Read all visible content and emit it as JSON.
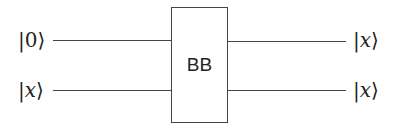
{
  "diagram": {
    "type": "quantum-circuit",
    "gate": {
      "label": "BB"
    },
    "inputs": [
      {
        "prefix": "|",
        "symbol": "0",
        "suffix": "⟩",
        "italic": false
      },
      {
        "prefix": "|",
        "symbol": "x",
        "suffix": "⟩",
        "italic": true
      }
    ],
    "outputs": [
      {
        "prefix": "|",
        "symbol": "x",
        "suffix": "⟩",
        "italic": true
      },
      {
        "prefix": "|",
        "symbol": "x",
        "suffix": "⟩",
        "italic": true
      }
    ],
    "colors": {
      "line": "#444444",
      "text": "#222222",
      "background": "#ffffff"
    }
  }
}
